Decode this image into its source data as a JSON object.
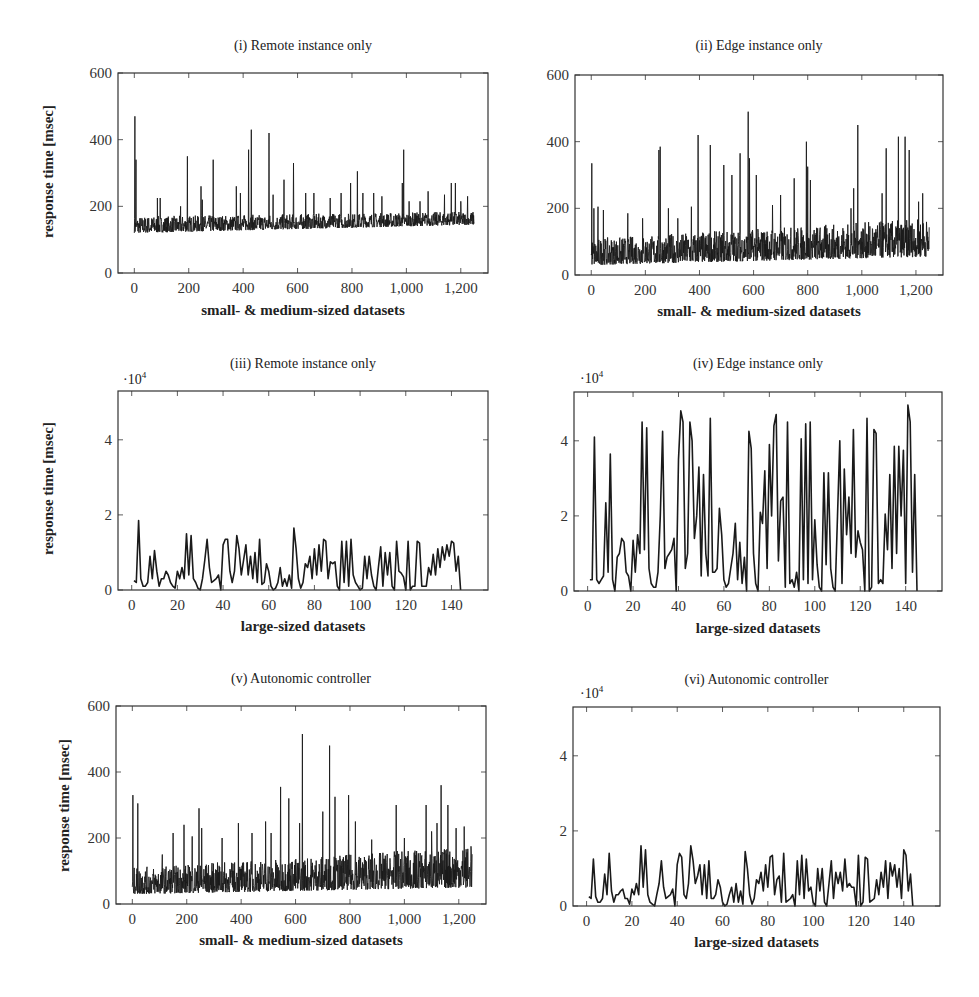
{
  "figure": {
    "ylabel": "response time [msec]"
  },
  "chart_data": [
    {
      "id": "i",
      "type": "line",
      "title": "(i) Remote instance only",
      "xlabel": "small- & medium-sized datasets",
      "ylabel": "response time [msec]",
      "xlim": [
        -60,
        1300
      ],
      "ylim": [
        0,
        600
      ],
      "xticks": [
        0,
        200,
        400,
        600,
        800,
        1000,
        1200
      ],
      "xtick_labels": [
        "0",
        "200",
        "400",
        "600",
        "800",
        "1,000",
        "1,200"
      ],
      "yticks": [
        0,
        200,
        400,
        600
      ],
      "ytick_labels": [
        "0",
        "200",
        "400",
        "600"
      ],
      "multiplier": "",
      "n_points": 1250,
      "baseline": {
        "low": [
          120,
          130,
          145
        ],
        "high": [
          170,
          175,
          185
        ]
      },
      "spikes": [
        [
          2,
          470
        ],
        [
          6,
          340
        ],
        [
          85,
          225
        ],
        [
          95,
          225
        ],
        [
          170,
          200
        ],
        [
          195,
          350
        ],
        [
          245,
          260
        ],
        [
          250,
          220
        ],
        [
          290,
          340
        ],
        [
          375,
          260
        ],
        [
          390,
          240
        ],
        [
          420,
          370
        ],
        [
          430,
          430
        ],
        [
          495,
          420
        ],
        [
          510,
          235
        ],
        [
          550,
          280
        ],
        [
          585,
          330
        ],
        [
          630,
          240
        ],
        [
          660,
          240
        ],
        [
          720,
          225
        ],
        [
          760,
          240
        ],
        [
          795,
          270
        ],
        [
          820,
          305
        ],
        [
          840,
          240
        ],
        [
          880,
          240
        ],
        [
          910,
          230
        ],
        [
          985,
          270
        ],
        [
          990,
          370
        ],
        [
          1010,
          215
        ],
        [
          1050,
          215
        ],
        [
          1080,
          245
        ],
        [
          1140,
          235
        ],
        [
          1165,
          270
        ],
        [
          1180,
          270
        ],
        [
          1200,
          215
        ],
        [
          1225,
          230
        ],
        [
          1250,
          190
        ]
      ]
    },
    {
      "id": "ii",
      "type": "line",
      "title": "(ii) Edge instance only",
      "xlabel": "small- & medium-sized datasets",
      "ylabel": "",
      "xlim": [
        -60,
        1300
      ],
      "ylim": [
        0,
        600
      ],
      "xticks": [
        0,
        200,
        400,
        600,
        800,
        1000,
        1200
      ],
      "xtick_labels": [
        "0",
        "200",
        "400",
        "600",
        "800",
        "1,000",
        "1,200"
      ],
      "yticks": [
        0,
        200,
        400,
        600
      ],
      "ytick_labels": [
        "0",
        "200",
        "400",
        "600"
      ],
      "multiplier": "",
      "n_points": 1250,
      "baseline": {
        "low": [
          30,
          40,
          55
        ],
        "high": [
          110,
          150,
          170
        ]
      },
      "spikes": [
        [
          2,
          335
        ],
        [
          10,
          200
        ],
        [
          25,
          205
        ],
        [
          45,
          195
        ],
        [
          135,
          185
        ],
        [
          190,
          170
        ],
        [
          250,
          375
        ],
        [
          255,
          385
        ],
        [
          285,
          200
        ],
        [
          320,
          170
        ],
        [
          370,
          205
        ],
        [
          395,
          420
        ],
        [
          440,
          390
        ],
        [
          490,
          330
        ],
        [
          520,
          300
        ],
        [
          550,
          365
        ],
        [
          580,
          490
        ],
        [
          585,
          350
        ],
        [
          610,
          300
        ],
        [
          670,
          210
        ],
        [
          700,
          240
        ],
        [
          750,
          290
        ],
        [
          795,
          400
        ],
        [
          800,
          325
        ],
        [
          810,
          285
        ],
        [
          960,
          200
        ],
        [
          970,
          260
        ],
        [
          985,
          450
        ],
        [
          1075,
          245
        ],
        [
          1090,
          380
        ],
        [
          1135,
          415
        ],
        [
          1160,
          415
        ],
        [
          1175,
          375
        ],
        [
          1210,
          220
        ],
        [
          1225,
          245
        ],
        [
          1250,
          180
        ]
      ]
    },
    {
      "id": "iii",
      "type": "line",
      "title": "(iii) Remote instance only",
      "xlabel": "large-sized datasets",
      "ylabel": "response time [msec]",
      "xlim": [
        -6,
        156
      ],
      "ylim": [
        0,
        5.3
      ],
      "xticks": [
        0,
        20,
        40,
        60,
        80,
        100,
        120,
        140
      ],
      "xtick_labels": [
        "0",
        "20",
        "40",
        "60",
        "80",
        "100",
        "120",
        "140"
      ],
      "yticks": [
        0,
        2,
        4
      ],
      "ytick_labels": [
        "0",
        "2",
        "4"
      ],
      "multiplier": "·10^4",
      "multiplier_base": "·10",
      "multiplier_exp": "4",
      "x": [
        1,
        2,
        3,
        4,
        5,
        6,
        7,
        8,
        9,
        10,
        11,
        12,
        13,
        14,
        15,
        16,
        17,
        18,
        19,
        20,
        21,
        22,
        23,
        24,
        25,
        26,
        27,
        28,
        29,
        30,
        31,
        32,
        33,
        34,
        35,
        36,
        37,
        38,
        39,
        40,
        41,
        42,
        43,
        44,
        45,
        46,
        47,
        48,
        49,
        50,
        51,
        52,
        53,
        54,
        55,
        56,
        57,
        58,
        59,
        60,
        61,
        62,
        63,
        64,
        65,
        66,
        67,
        68,
        69,
        70,
        71,
        72,
        73,
        74,
        75,
        76,
        77,
        78,
        79,
        80,
        81,
        82,
        83,
        84,
        85,
        86,
        87,
        88,
        89,
        90,
        91,
        92,
        93,
        94,
        95,
        96,
        97,
        98,
        99,
        100,
        101,
        102,
        103,
        104,
        105,
        106,
        107,
        108,
        109,
        110,
        111,
        112,
        113,
        114,
        115,
        116,
        117,
        118,
        119,
        120,
        121,
        122,
        123,
        124,
        125,
        126,
        127,
        128,
        129,
        130,
        131,
        132,
        133,
        134,
        135,
        136,
        137,
        138,
        139,
        140,
        141,
        142,
        143,
        144,
        145,
        146,
        147,
        148
      ],
      "values": [
        0.25,
        0.2,
        1.85,
        0.3,
        0.1,
        0.1,
        0.2,
        0.9,
        0.3,
        1.05,
        0.5,
        0.1,
        0.3,
        0.3,
        0.5,
        0.4,
        0.2,
        0.1,
        0.05,
        0.5,
        0.3,
        0.6,
        0.3,
        1.5,
        0.4,
        1.45,
        0.3,
        0.2,
        0.05,
        0.0,
        0.3,
        0.8,
        1.35,
        0.6,
        0.2,
        0.25,
        0.3,
        0.4,
        0.0,
        1.2,
        1.35,
        1.35,
        0.5,
        0.2,
        0.5,
        1.45,
        1.1,
        0.4,
        0.8,
        1.2,
        0.4,
        0.9,
        0.3,
        1.0,
        0.2,
        1.35,
        0.15,
        0.2,
        0.7,
        0.5,
        0.1,
        0.0,
        0.05,
        0.2,
        0.6,
        0.1,
        0.3,
        0.1,
        0.4,
        0.05,
        1.65,
        1.1,
        0.3,
        0.05,
        0.2,
        0.7,
        0.6,
        0.9,
        0.3,
        1.1,
        0.4,
        1.2,
        0.5,
        1.35,
        1.3,
        0.3,
        0.75,
        0.7,
        0.75,
        0.1,
        0.0,
        1.3,
        0.2,
        1.3,
        0.1,
        1.35,
        0.4,
        0.2,
        0.1,
        0.0,
        0.05,
        0.9,
        0.3,
        0.9,
        0.4,
        0.1,
        0.0,
        0.6,
        1.15,
        0.1,
        1.0,
        0.4,
        1.0,
        0.1,
        0.0,
        1.3,
        0.5,
        0.45,
        0.35,
        0.0,
        1.3,
        0.0,
        0.1,
        0.1,
        1.3,
        1.25,
        0.1,
        0.1,
        0.1,
        0.6,
        0.4,
        0.95,
        0.4,
        1.1,
        0.6,
        1.15,
        0.8,
        1.2,
        0.9,
        1.3,
        1.25,
        0.5,
        0.9,
        0.0
      ],
      "note": "values in units of 10^4 msec"
    },
    {
      "id": "iv",
      "type": "line",
      "title": "(iv) Edge instance only",
      "xlabel": "large-sized datasets",
      "ylabel": "",
      "xlim": [
        -6,
        156
      ],
      "ylim": [
        0,
        5.3
      ],
      "xticks": [
        0,
        20,
        40,
        60,
        80,
        100,
        120,
        140
      ],
      "xtick_labels": [
        "0",
        "20",
        "40",
        "60",
        "80",
        "100",
        "120",
        "140"
      ],
      "yticks": [
        0,
        2,
        4
      ],
      "ytick_labels": [
        "0",
        "2",
        "4"
      ],
      "multiplier": "·10^4",
      "multiplier_base": "·10",
      "multiplier_exp": "4",
      "values": [
        0.3,
        0.3,
        4.1,
        0.3,
        0.2,
        0.3,
        0.4,
        2.35,
        0.5,
        3.65,
        0.3,
        0.0,
        0.9,
        1.0,
        1.4,
        1.3,
        0.5,
        0.4,
        0.0,
        1.35,
        0.5,
        1.5,
        1.0,
        4.5,
        1.1,
        4.35,
        0.6,
        0.2,
        0.1,
        0.1,
        0.5,
        2.0,
        4.25,
        0.6,
        0.9,
        1.0,
        1.1,
        1.4,
        0.0,
        3.5,
        4.8,
        4.5,
        0.6,
        1.0,
        4.5,
        4.0,
        1.4,
        2.0,
        3.3,
        0.4,
        3.1,
        1.0,
        0.4,
        4.6,
        0.5,
        0.5,
        0.6,
        2.2,
        1.5,
        0.3,
        0.1,
        0.2,
        0.6,
        1.0,
        1.8,
        0.3,
        1.3,
        0.2,
        0.9,
        0.0,
        4.25,
        3.8,
        1.0,
        0.2,
        0.0,
        2.1,
        1.8,
        3.2,
        0.6,
        3.9,
        2.0,
        4.4,
        4.7,
        0.8,
        2.4,
        2.5,
        0.1,
        4.5,
        0.2,
        0.3,
        0.1,
        0.5,
        0.0,
        4.05,
        0.3,
        4.45,
        0.2,
        4.5,
        0.3,
        1.9,
        0.7,
        0.1,
        0.0,
        3.15,
        0.7,
        3.15,
        0.6,
        0.1,
        0.0,
        2.0,
        4.0,
        0.2,
        3.25,
        1.5,
        2.5,
        1.0,
        4.3,
        0.9,
        1.6,
        1.3,
        1.1,
        0.0,
        4.6,
        0.0,
        0.1,
        4.3,
        4.2,
        0.2,
        0.3,
        0.2,
        2.05,
        1.1,
        3.1,
        0.6,
        3.85,
        1.0,
        3.85,
        2.0,
        3.75,
        0.2,
        4.95,
        4.5,
        0.5,
        3.1,
        0.0
      ],
      "note": "values in units of 10^4 msec"
    },
    {
      "id": "v",
      "type": "line",
      "title": "(v) Autonomic controller",
      "xlabel": "small- & medium-sized datasets",
      "ylabel": "response time [msec]",
      "xlim": [
        -60,
        1300
      ],
      "ylim": [
        0,
        600
      ],
      "xticks": [
        0,
        200,
        400,
        600,
        800,
        1000,
        1200
      ],
      "xtick_labels": [
        "0",
        "200",
        "400",
        "600",
        "800",
        "1,000",
        "1,200"
      ],
      "yticks": [
        0,
        200,
        400,
        600
      ],
      "ytick_labels": [
        "0",
        "200",
        "400",
        "600"
      ],
      "multiplier": "",
      "n_points": 1250,
      "baseline": {
        "low": [
          30,
          40,
          50
        ],
        "high": [
          110,
          150,
          175
        ]
      },
      "spikes": [
        [
          2,
          330
        ],
        [
          20,
          305
        ],
        [
          110,
          150
        ],
        [
          150,
          215
        ],
        [
          190,
          240
        ],
        [
          220,
          205
        ],
        [
          245,
          290
        ],
        [
          255,
          230
        ],
        [
          330,
          200
        ],
        [
          390,
          245
        ],
        [
          440,
          215
        ],
        [
          490,
          250
        ],
        [
          510,
          215
        ],
        [
          545,
          355
        ],
        [
          575,
          320
        ],
        [
          615,
          245
        ],
        [
          625,
          515
        ],
        [
          700,
          280
        ],
        [
          725,
          480
        ],
        [
          745,
          325
        ],
        [
          795,
          330
        ],
        [
          820,
          250
        ],
        [
          880,
          195
        ],
        [
          970,
          300
        ],
        [
          1000,
          200
        ],
        [
          1080,
          300
        ],
        [
          1100,
          220
        ],
        [
          1120,
          245
        ],
        [
          1135,
          360
        ],
        [
          1160,
          300
        ],
        [
          1190,
          230
        ],
        [
          1220,
          235
        ],
        [
          1245,
          175
        ]
      ]
    },
    {
      "id": "vi",
      "type": "line",
      "title": "(vi) Autonomic controller",
      "xlabel": "large-sized datasets",
      "ylabel": "",
      "xlim": [
        -6,
        156
      ],
      "ylim": [
        0,
        5.3
      ],
      "xticks": [
        0,
        20,
        40,
        60,
        80,
        100,
        120,
        140
      ],
      "xtick_labels": [
        "0",
        "20",
        "40",
        "60",
        "80",
        "100",
        "120",
        "140"
      ],
      "yticks": [
        0,
        2,
        4
      ],
      "ytick_labels": [
        "0",
        "2",
        "4"
      ],
      "multiplier": "·10^4",
      "multiplier_base": "·10",
      "multiplier_exp": "4",
      "values": [
        0.25,
        0.2,
        1.25,
        0.25,
        0.1,
        0.1,
        0.2,
        0.85,
        0.3,
        1.4,
        0.4,
        0.1,
        0.3,
        0.3,
        0.4,
        0.45,
        0.2,
        0.2,
        0.05,
        0.45,
        0.3,
        0.6,
        0.3,
        1.6,
        0.5,
        1.5,
        0.3,
        0.1,
        0.05,
        0.0,
        0.3,
        0.6,
        1.2,
        0.5,
        0.2,
        0.25,
        0.3,
        0.45,
        0.0,
        1.1,
        1.4,
        1.3,
        0.3,
        0.2,
        0.6,
        1.6,
        1.2,
        0.6,
        0.8,
        1.1,
        0.3,
        1.1,
        0.2,
        1.2,
        0.2,
        0.2,
        0.3,
        0.7,
        0.5,
        0.1,
        0.0,
        0.05,
        0.3,
        0.5,
        0.1,
        0.6,
        0.1,
        0.4,
        0.05,
        1.45,
        1.0,
        0.3,
        0.05,
        0.2,
        0.7,
        0.6,
        0.9,
        0.4,
        1.1,
        0.5,
        1.3,
        1.35,
        0.3,
        0.7,
        0.8,
        0.1,
        1.4,
        0.1,
        0.15,
        0.2,
        0.3,
        0.0,
        1.2,
        0.3,
        1.35,
        0.2,
        1.25,
        0.4,
        0.5,
        0.1,
        0.0,
        1.0,
        0.4,
        1.0,
        0.1,
        0.0,
        0.6,
        1.2,
        0.2,
        0.9,
        0.6,
        0.9,
        0.4,
        1.25,
        0.5,
        0.6,
        0.5,
        0.5,
        0.0,
        1.35,
        0.0,
        0.1,
        1.3,
        1.25,
        0.1,
        0.15,
        0.2,
        0.7,
        0.3,
        0.9,
        0.5,
        1.2,
        0.2,
        1.15,
        0.8,
        1.1,
        0.5,
        1.0,
        0.2,
        1.5,
        1.35,
        0.4,
        0.85,
        0.0
      ],
      "note": "values in units of 10^4 msec"
    }
  ],
  "panels": {
    "i": {
      "box": [
        118,
        73,
        488,
        273
      ]
    },
    "ii": {
      "box": [
        575,
        75,
        943,
        275
      ]
    },
    "iii": {
      "box": [
        118,
        391,
        488,
        590
      ]
    },
    "iv": {
      "box": [
        574,
        392,
        942,
        591
      ]
    },
    "v": {
      "box": [
        116,
        706,
        486,
        904
      ]
    },
    "vi": {
      "box": [
        573,
        707,
        940,
        906
      ]
    }
  },
  "style": {
    "line_color": "#1a1a1a",
    "axis_color": "#333333",
    "background": "#ffffff"
  }
}
